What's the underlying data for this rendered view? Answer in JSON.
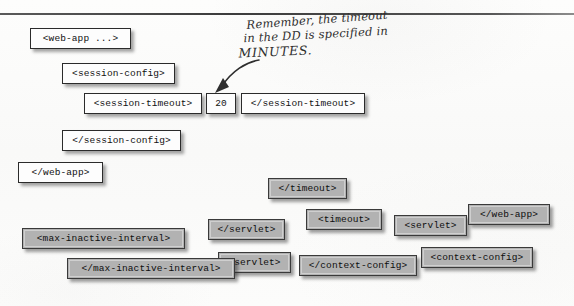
{
  "page": {
    "kind": "scanned-book-figure",
    "divider": "horizontal-rule"
  },
  "annotation": {
    "line1": "Remember, the timeout",
    "line2": "in the DD is specified in",
    "line3": "MINUTES.",
    "arrow": "curved-arrow-pointing-down-left"
  },
  "correct_snippet": {
    "style": "white",
    "tags": [
      {
        "label": "<web-app ...>",
        "x": 30,
        "y": 28,
        "w": 101
      },
      {
        "label": "<session-config>",
        "x": 62,
        "y": 63,
        "w": 113
      },
      {
        "label": "<session-timeout>",
        "x": 84,
        "y": 93,
        "w": 118
      },
      {
        "label": "20",
        "x": 206,
        "y": 93,
        "w": 30
      },
      {
        "label": "</session-timeout>",
        "x": 241,
        "y": 93,
        "w": 124
      },
      {
        "label": "</session-config>",
        "x": 62,
        "y": 130,
        "w": 119
      },
      {
        "label": "</web-app>",
        "x": 18,
        "y": 162,
        "w": 85
      }
    ]
  },
  "distractor_magnets": {
    "style": "gray",
    "tags": [
      {
        "label": "</timeout>",
        "x": 268,
        "y": 178,
        "w": 79
      },
      {
        "label": "<timeout>",
        "x": 306,
        "y": 209,
        "w": 76
      },
      {
        "label": "<servlet>",
        "x": 394,
        "y": 215,
        "w": 73
      },
      {
        "label": "</web-app>",
        "x": 468,
        "y": 204,
        "w": 82
      },
      {
        "label": "</servlet>",
        "x": 208,
        "y": 219,
        "w": 77
      },
      {
        "label": "<max-inactive-interval>",
        "x": 22,
        "y": 228,
        "w": 163
      },
      {
        "label": "<servlet>",
        "x": 218,
        "y": 252,
        "w": 73
      },
      {
        "label": "</max-inactive-interval>",
        "x": 67,
        "y": 258,
        "w": 168
      },
      {
        "label": "</context-config>",
        "x": 299,
        "y": 255,
        "w": 118
      },
      {
        "label": "<context-config>",
        "x": 421,
        "y": 247,
        "w": 112
      }
    ]
  }
}
